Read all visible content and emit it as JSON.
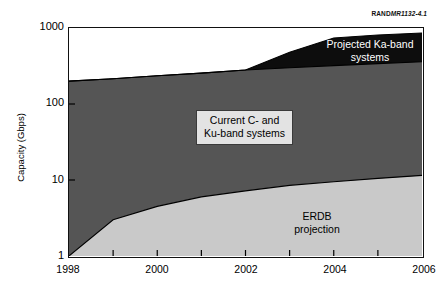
{
  "source_code": {
    "prefix": "RAND",
    "number": "MR1132-4.1"
  },
  "chart_data": {
    "type": "area",
    "title": "",
    "subtitle": "",
    "xlabel": "",
    "ylabel": "Capacity (Gbps)",
    "x": [
      1998,
      1999,
      2000,
      2001,
      2002,
      2003,
      2004,
      2005,
      2006
    ],
    "xlim": [
      1998,
      2006
    ],
    "xticks": [
      1998,
      2000,
      2002,
      2004,
      2006
    ],
    "xtick_labels": [
      "1998",
      "2000",
      "2002",
      "2004",
      "2006"
    ],
    "xtick_minor": [
      1999,
      2001,
      2003,
      2005
    ],
    "yscale": "log",
    "ylim": [
      1,
      1000
    ],
    "yticks": [
      1,
      10,
      100,
      1000
    ],
    "ytick_labels": [
      "1",
      "10",
      "100",
      "1000"
    ],
    "grid": false,
    "legend": "inline-annotations",
    "stacked": true,
    "series": [
      {
        "name": "ERDB projection",
        "color": "#c9c9c9",
        "values": [
          1.0,
          3.0,
          4.5,
          6.0,
          7.2,
          8.5,
          9.5,
          10.5,
          11.5
        ]
      },
      {
        "name": "Current C- and Ku-band systems",
        "color": "#555555",
        "values": [
          200,
          215,
          235,
          255,
          280,
          300,
          320,
          340,
          360
        ]
      },
      {
        "name": "Projected Ka-band systems",
        "color": "#0d0d0d",
        "values": [
          0,
          0,
          0,
          0,
          0,
          180,
          420,
          470,
          500
        ]
      }
    ],
    "annotations": [
      {
        "id": "ka-band",
        "lines": [
          "Projected Ka-band",
          "systems"
        ],
        "text_color": "#ffffff"
      },
      {
        "id": "current-ku",
        "lines": [
          "Current C- and",
          "Ku-band systems"
        ],
        "text_color": "#000000",
        "boxed": true
      },
      {
        "id": "erdb",
        "lines": [
          "ERDB",
          "projection"
        ],
        "text_color": "#000000"
      }
    ]
  }
}
